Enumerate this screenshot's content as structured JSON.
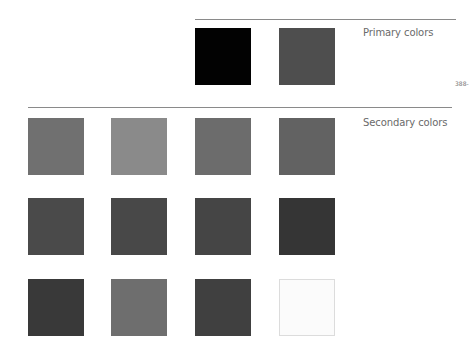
{
  "primary": {
    "label": "Primary colors",
    "swatches": [
      {
        "name": "black",
        "color": "#020202"
      },
      {
        "name": "dark-gray",
        "color": "#4e4e4e"
      }
    ]
  },
  "page_number": "388-",
  "secondary": {
    "label": "Secondary colors",
    "swatches": [
      {
        "color": "#707070"
      },
      {
        "color": "#8a8a8a"
      },
      {
        "color": "#6c6c6c"
      },
      {
        "color": "#626262"
      },
      {
        "color": "#4a4a4a"
      },
      {
        "color": "#484848"
      },
      {
        "color": "#454545"
      },
      {
        "color": "#353535"
      },
      {
        "color": "#393939"
      },
      {
        "color": "#6e6e6e"
      },
      {
        "color": "#404040"
      },
      {
        "color": "#fbfbfb",
        "border": "#dcdcdc"
      }
    ]
  }
}
